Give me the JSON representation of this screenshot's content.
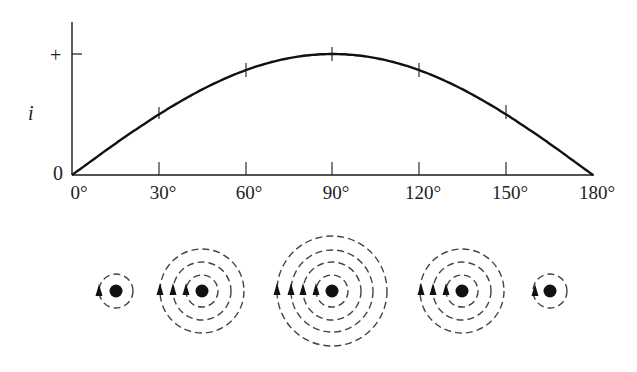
{
  "chart_data": {
    "type": "line",
    "title": "",
    "xlabel": "",
    "ylabel": "i",
    "x": [
      0,
      30,
      60,
      90,
      120,
      150,
      180
    ],
    "values": [
      0,
      0.5,
      0.866,
      1.0,
      0.866,
      0.5,
      0
    ],
    "x_tick_labels": [
      "0°",
      "30°",
      "60°",
      "90°",
      "120°",
      "150°",
      "180°"
    ],
    "y_tick_labels": [
      "0",
      "+"
    ],
    "xlim": [
      0,
      180
    ],
    "ylim": [
      0,
      1.25
    ],
    "grid": false,
    "legend": null,
    "series": [
      {
        "name": "i = sin θ",
        "curve": "half sine wave"
      }
    ]
  },
  "axis": {
    "y_label": "i",
    "y_zero": "0",
    "y_plus": "+",
    "x_ticks": [
      "0°",
      "30°",
      "60°",
      "90°",
      "120°",
      "150°",
      "180°"
    ]
  },
  "field_diagrams": [
    {
      "angle": "30°",
      "rings": 1,
      "arrows": 1
    },
    {
      "angle": "45°",
      "rings": 3,
      "arrows": 3
    },
    {
      "angle": "90°",
      "rings": 4,
      "arrows": 4
    },
    {
      "angle": "135°",
      "rings": 3,
      "arrows": 3
    },
    {
      "angle": "165°",
      "rings": 1,
      "arrows": 1
    }
  ],
  "colors": {
    "ink": "#1a1a1a",
    "dash": "#444444",
    "background": "#ffffff"
  }
}
